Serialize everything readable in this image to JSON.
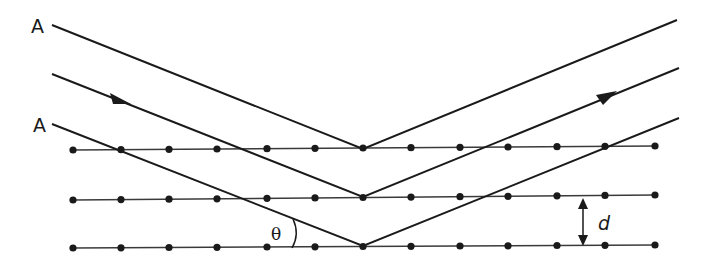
{
  "diagram": {
    "labels": {
      "ray_top": "A",
      "ray_bottom": "A",
      "angle": "θ",
      "spacing": "d"
    },
    "colors": {
      "line": "#1a1a1a",
      "background": "#ffffff"
    },
    "planes": [
      {
        "y": 149,
        "dots_x": [
          73,
          121,
          169,
          217,
          267,
          315,
          363,
          411,
          460,
          508,
          557,
          605,
          655
        ]
      },
      {
        "y": 199,
        "dots_x": [
          73,
          121,
          169,
          217,
          267,
          315,
          363,
          411,
          460,
          508,
          557,
          605,
          655
        ]
      },
      {
        "y": 247,
        "dots_x": [
          73,
          121,
          169,
          217,
          267,
          315,
          363,
          411,
          460,
          508,
          557,
          605,
          655
        ]
      }
    ],
    "rays": [
      {
        "name": "ray-1",
        "start": [
          52,
          25
        ],
        "vertex": [
          363,
          149
        ],
        "end": [
          677,
          20
        ]
      },
      {
        "name": "ray-2",
        "start": [
          52,
          74
        ],
        "vertex": [
          363,
          197
        ],
        "end": [
          679,
          68
        ],
        "arrow_in": [
          120,
          100
        ],
        "arrow_out": [
          608,
          96
        ]
      },
      {
        "name": "ray-3",
        "start": [
          52,
          124
        ],
        "vertex": [
          363,
          246
        ],
        "end": [
          679,
          118
        ]
      }
    ]
  }
}
